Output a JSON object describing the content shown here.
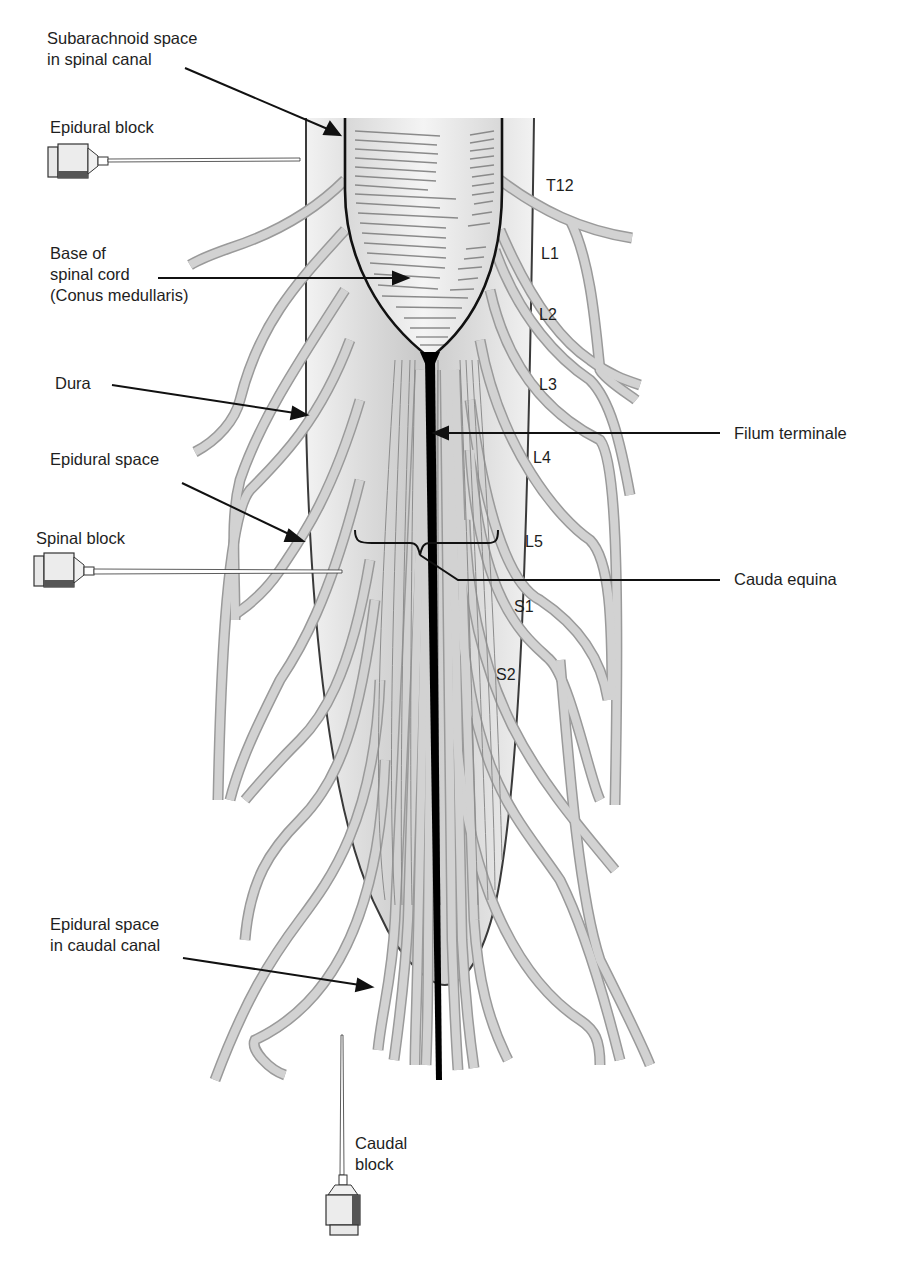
{
  "figure": {
    "colors": {
      "nerve_fill": "#cfcfcf",
      "nerve_edge": "#9a9a9a",
      "dura_line": "#3a3a3a",
      "cord_outline": "#111111",
      "filum": "#000000",
      "canal_shade": "#d9d9d9",
      "label_text": "#1e1e1e"
    }
  },
  "labels": {
    "subarachnoid": [
      "Subarachnoid space",
      "in spinal canal"
    ],
    "epidural_block": "Epidural block",
    "base_of_cord": [
      "Base of",
      "spinal cord",
      "(Conus medullaris)"
    ],
    "dura": "Dura",
    "epidural_space": "Epidural space",
    "spinal_block": "Spinal block",
    "filum_terminale": "Filum terminale",
    "cauda_equina": "Cauda equina",
    "epidural_caudal": [
      "Epidural space",
      "in caudal canal"
    ],
    "caudal_block": [
      "Caudal",
      "block"
    ]
  },
  "segments": [
    "T12",
    "L1",
    "L2",
    "L3",
    "L4",
    "L5",
    "S1",
    "S2"
  ]
}
